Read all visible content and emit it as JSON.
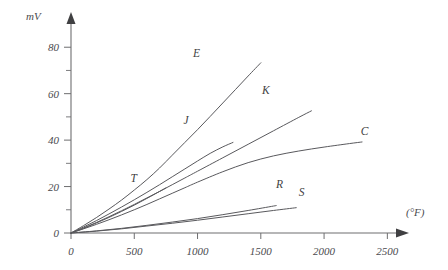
{
  "chart_data": {
    "type": "line",
    "title": "",
    "xlabel": "(°F)",
    "ylabel": "mV",
    "xlim": [
      0,
      2600
    ],
    "ylim": [
      0,
      90
    ],
    "grid": false,
    "legend_position": "inline-end-of-line",
    "x_ticks": [
      {
        "value": 0,
        "label": "0"
      },
      {
        "value": 500,
        "label": "500"
      },
      {
        "value": 1000,
        "label": "1000"
      },
      {
        "value": 1500,
        "label": "1500"
      },
      {
        "value": 2000,
        "label": "2000"
      },
      {
        "value": 2500,
        "label": "2500"
      }
    ],
    "y_ticks": [
      {
        "value": 0,
        "label": "0"
      },
      {
        "value": 10,
        "label": ""
      },
      {
        "value": 20,
        "label": "20"
      },
      {
        "value": 30,
        "label": ""
      },
      {
        "value": 40,
        "label": "40"
      },
      {
        "value": 50,
        "label": ""
      },
      {
        "value": 60,
        "label": "60"
      },
      {
        "value": 70,
        "label": ""
      },
      {
        "value": 80,
        "label": "80"
      }
    ],
    "series": [
      {
        "name": "E",
        "label": "E",
        "label_x": 965,
        "label_y": 76,
        "points": [
          [
            0,
            0
          ],
          [
            100,
            3.2
          ],
          [
            200,
            6.6
          ],
          [
            300,
            10.3
          ],
          [
            400,
            14.2
          ],
          [
            500,
            18.5
          ],
          [
            600,
            23.0
          ],
          [
            700,
            28.0
          ],
          [
            800,
            33.5
          ],
          [
            900,
            39.0
          ],
          [
            1000,
            44.5
          ],
          [
            1100,
            50.2
          ],
          [
            1200,
            56.0
          ],
          [
            1300,
            61.8
          ],
          [
            1400,
            67.6
          ],
          [
            1500,
            73.3
          ]
        ],
        "draw_to_x": 1500,
        "draw_to_y": 73.3
      },
      {
        "name": "K",
        "label": "K",
        "label_x": 1510,
        "label_y": 60,
        "points": [
          [
            0,
            0
          ],
          [
            100,
            2.2
          ],
          [
            200,
            4.5
          ],
          [
            300,
            7.0
          ],
          [
            400,
            9.6
          ],
          [
            500,
            12.3
          ],
          [
            600,
            15.1
          ],
          [
            700,
            17.9
          ],
          [
            800,
            20.8
          ],
          [
            900,
            23.7
          ],
          [
            1000,
            26.6
          ],
          [
            1200,
            32.4
          ],
          [
            1400,
            38.2
          ],
          [
            1600,
            44.0
          ],
          [
            1800,
            49.8
          ],
          [
            1900,
            52.6
          ]
        ],
        "draw_to_x": 1900,
        "draw_to_y": 52.6
      },
      {
        "name": "J",
        "label": "J",
        "label_x": 890,
        "label_y": 47,
        "points": [
          [
            0,
            0
          ],
          [
            100,
            2.6
          ],
          [
            200,
            5.3
          ],
          [
            300,
            8.2
          ],
          [
            400,
            11.2
          ],
          [
            500,
            14.3
          ],
          [
            600,
            17.5
          ],
          [
            700,
            20.8
          ],
          [
            800,
            24.2
          ],
          [
            900,
            27.6
          ],
          [
            1000,
            31.0
          ],
          [
            1100,
            34.3
          ],
          [
            1200,
            37.1
          ],
          [
            1280,
            39.0
          ]
        ],
        "draw_to_x": 1280,
        "draw_to_y": 39.0
      },
      {
        "name": "T",
        "label": "T",
        "label_x": 470,
        "label_y": 22,
        "points": [
          [
            0,
            0
          ],
          [
            100,
            2.0
          ],
          [
            200,
            4.3
          ],
          [
            300,
            6.7
          ],
          [
            400,
            9.3
          ],
          [
            500,
            12.0
          ],
          [
            600,
            14.9
          ],
          [
            700,
            17.9
          ],
          [
            750,
            19.4
          ]
        ],
        "draw_to_x": 750,
        "draw_to_y": 19.4
      },
      {
        "name": "C",
        "label": "C",
        "label_x": 2290,
        "label_y": 42,
        "points": [
          [
            0,
            0
          ],
          [
            100,
            1.8
          ],
          [
            200,
            3.7
          ],
          [
            300,
            5.7
          ],
          [
            400,
            7.8
          ],
          [
            500,
            10.0
          ],
          [
            600,
            12.3
          ],
          [
            700,
            14.7
          ],
          [
            800,
            17.1
          ],
          [
            900,
            19.5
          ],
          [
            1000,
            21.9
          ],
          [
            1200,
            26.4
          ],
          [
            1400,
            30.3
          ],
          [
            1600,
            33.2
          ],
          [
            1800,
            35.3
          ],
          [
            2000,
            37.0
          ],
          [
            2200,
            38.5
          ],
          [
            2300,
            39.2
          ]
        ],
        "draw_to_x": 2300,
        "draw_to_y": 39.2
      },
      {
        "name": "R",
        "label": "R",
        "label_x": 1620,
        "label_y": 19.5,
        "points": [
          [
            0,
            0
          ],
          [
            200,
            0.9
          ],
          [
            400,
            2.0
          ],
          [
            600,
            3.3
          ],
          [
            800,
            4.7
          ],
          [
            1000,
            6.2
          ],
          [
            1200,
            7.9
          ],
          [
            1400,
            9.7
          ],
          [
            1600,
            11.6
          ],
          [
            1620,
            11.8
          ]
        ],
        "draw_to_x": 1620,
        "draw_to_y": 11.8
      },
      {
        "name": "S",
        "label": "S",
        "label_x": 1800,
        "label_y": 16,
        "points": [
          [
            0,
            0
          ],
          [
            200,
            0.8
          ],
          [
            400,
            1.8
          ],
          [
            600,
            3.0
          ],
          [
            800,
            4.2
          ],
          [
            1000,
            5.5
          ],
          [
            1200,
            6.9
          ],
          [
            1400,
            8.3
          ],
          [
            1600,
            9.7
          ],
          [
            1780,
            10.9
          ]
        ],
        "draw_to_x": 1780,
        "draw_to_y": 10.9
      }
    ],
    "colors": {
      "line": "#59595d",
      "axis": "#6e6e70",
      "text": "#4a4a4e",
      "background": "#ffffff"
    }
  }
}
